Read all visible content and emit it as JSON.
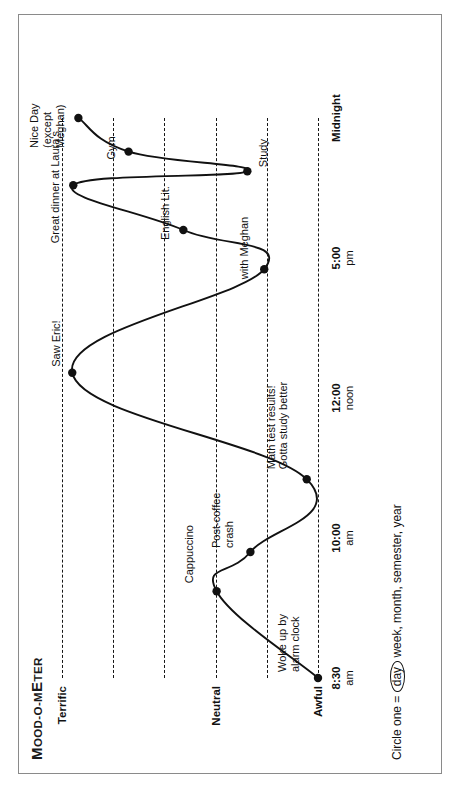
{
  "worksheet": {
    "title_full": "MOOD-O-METER",
    "title_cap": "M",
    "title_rest": "OOD-O-M",
    "title_rest2": "ETER",
    "caption_prefix": "Circle one = ",
    "caption_circled": "day",
    "caption_suffix": " week, month, semester, year"
  },
  "chart_data": {
    "type": "line",
    "title": "MOOD-O-METER",
    "xlabel": "",
    "ylabel": "",
    "orientation": "printed sideways (rotated 90° counter-clockwise)",
    "grid": true,
    "legend": "none",
    "y_levels": [
      {
        "label": "Terrific",
        "value": 5,
        "bold": true
      },
      {
        "label": "",
        "value": 4,
        "bold": false
      },
      {
        "label": "",
        "value": 3,
        "bold": false
      },
      {
        "label": "Neutral",
        "value": 2,
        "bold": true
      },
      {
        "label": "",
        "value": 1,
        "bold": false
      },
      {
        "label": "Awful",
        "value": 0,
        "bold": true
      }
    ],
    "x_ticks": [
      {
        "time": "8:30",
        "meridiem": "am"
      },
      {
        "time": "10:00",
        "meridiem": "am"
      },
      {
        "time": "12:00",
        "meridiem": "noon"
      },
      {
        "time": "5:00",
        "meridiem": "pm"
      },
      {
        "time": "Midnight",
        "meridiem": ""
      }
    ],
    "points": [
      {
        "x": 0.0,
        "y": 0.0,
        "annotation": "Woke up by\nalarm clock"
      },
      {
        "x": 0.155,
        "y": 1.98,
        "annotation": "Cappuccino"
      },
      {
        "x": 0.225,
        "y": 1.32,
        "annotation": "Post-coffee\ncrash"
      },
      {
        "x": 0.355,
        "y": 0.22,
        "annotation": "Math test results!\nGotta study better"
      },
      {
        "x": 0.545,
        "y": 4.8,
        "annotation": "Saw Eric!"
      },
      {
        "x": 0.73,
        "y": 1.05,
        "annotation": "with Meghan"
      },
      {
        "x": 0.8,
        "y": 2.63,
        "annotation": "English Lit."
      },
      {
        "x": 0.88,
        "y": 4.78,
        "annotation": "Great dinner at Laura's"
      },
      {
        "x": 0.905,
        "y": 1.38,
        "annotation": "Study"
      },
      {
        "x": 0.94,
        "y": 3.7,
        "annotation": "Gym"
      },
      {
        "x": 1.0,
        "y": 4.68,
        "annotation": "Nice Day\n(except\nMeghan)"
      }
    ],
    "annotations": [
      "Woke up by alarm clock",
      "Cappuccino",
      "Post-coffee crash",
      "Math test results! Gotta study better",
      "Saw Eric!",
      "with Meghan",
      "English Lit.",
      "Great dinner at Laura's",
      "Study",
      "Gym",
      "Nice Day (except Meghan)"
    ],
    "colors": {
      "line": "#111111",
      "marker": "#111111",
      "grid": "#161616",
      "text": "#111111",
      "border": "#8a8a8a"
    }
  }
}
